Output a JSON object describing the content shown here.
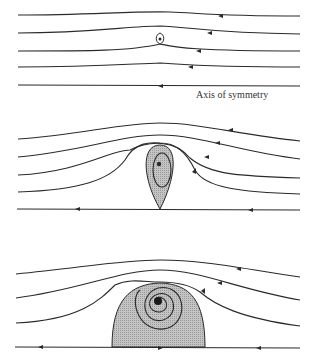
{
  "figure": {
    "axis_label": "Axis of symmetry",
    "panels": [
      {
        "id": "top",
        "description": "Small vortex ring, streamlines nearly straight"
      },
      {
        "id": "middle",
        "description": "Teardrop-shaped recirculating region with closed streamline"
      },
      {
        "id": "bottom",
        "description": "Larger dome-shaped recirculating region with spiral streamlines"
      }
    ],
    "colors": {
      "line": "#2a2a2a",
      "fill": "#b8b8b8",
      "background": "#ffffff"
    }
  }
}
